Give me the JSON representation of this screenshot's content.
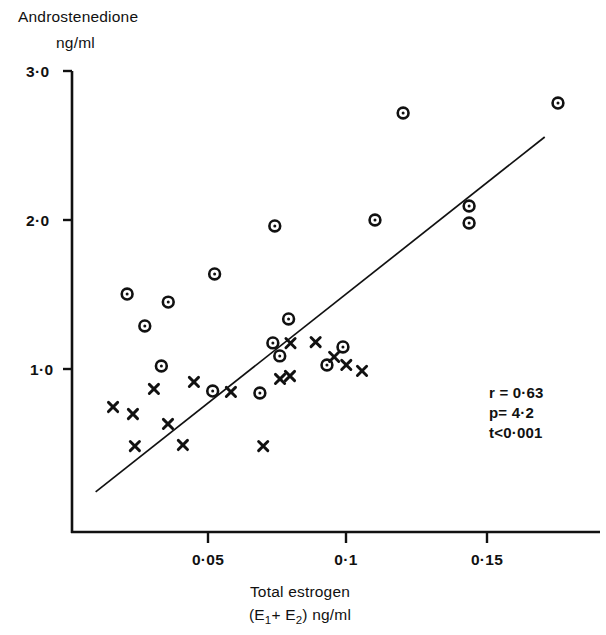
{
  "chart_data": {
    "type": "scatter",
    "title": "",
    "ylabel_lines": [
      "Androstenedione",
      "ng/ml"
    ],
    "xlabel_lines": [
      "Total   estrogen",
      "(E1+ E2)  ng/ml"
    ],
    "xlabel_line2_parts": [
      "(E",
      "1",
      "+ E",
      "2",
      ")  ng/ml"
    ],
    "xlim": [
      0.0,
      0.19
    ],
    "ylim": [
      0.0,
      3.0
    ],
    "xticks": [
      0.05,
      0.1,
      0.15
    ],
    "xticklabels": [
      "0·05",
      "0·1",
      "0·15"
    ],
    "yticks": [
      1.0,
      2.0,
      3.0
    ],
    "yticklabels": [
      "1·0",
      "2·0",
      "3·0"
    ],
    "grid": false,
    "legend": null,
    "marker_styles": {
      "circle": "open circle with centre dot",
      "cross": "x cross"
    },
    "series": [
      {
        "name": "circle-group",
        "marker": "circle",
        "points": [
          {
            "x": 0.0207,
            "y": 1.503
          },
          {
            "x": 0.0356,
            "y": 1.449
          },
          {
            "x": 0.0331,
            "y": 1.02
          },
          {
            "x": 0.0524,
            "y": 1.638
          },
          {
            "x": 0.0271,
            "y": 1.289
          },
          {
            "x": 0.0517,
            "y": 0.852
          },
          {
            "x": 0.0742,
            "y": 1.96
          },
          {
            "x": 0.0792,
            "y": 1.336
          },
          {
            "x": 0.0735,
            "y": 1.175
          },
          {
            "x": 0.076,
            "y": 1.088
          },
          {
            "x": 0.0688,
            "y": 0.839
          },
          {
            "x": 0.0989,
            "y": 1.148
          },
          {
            "x": 0.0931,
            "y": 1.027
          },
          {
            "x": 0.1105,
            "y": 2.0
          },
          {
            "x": 0.1207,
            "y": 2.718
          },
          {
            "x": 0.1446,
            "y": 2.094
          },
          {
            "x": 0.1446,
            "y": 1.98
          },
          {
            "x": 0.1768,
            "y": 2.785
          }
        ]
      },
      {
        "name": "cross-group",
        "marker": "cross",
        "points": [
          {
            "x": 0.0156,
            "y": 0.745
          },
          {
            "x": 0.0228,
            "y": 0.698
          },
          {
            "x": 0.0304,
            "y": 0.866
          },
          {
            "x": 0.0449,
            "y": 0.913
          },
          {
            "x": 0.0355,
            "y": 0.631
          },
          {
            "x": 0.0235,
            "y": 0.483
          },
          {
            "x": 0.0409,
            "y": 0.49
          },
          {
            "x": 0.07,
            "y": 0.483
          },
          {
            "x": 0.0583,
            "y": 0.846
          },
          {
            "x": 0.0761,
            "y": 0.933
          },
          {
            "x": 0.0797,
            "y": 0.953
          },
          {
            "x": 0.0799,
            "y": 1.174
          },
          {
            "x": 0.089,
            "y": 1.181
          },
          {
            "x": 0.0957,
            "y": 1.081
          },
          {
            "x": 0.1001,
            "y": 1.027
          },
          {
            "x": 0.1058,
            "y": 0.987
          }
        ]
      }
    ],
    "regression_line": {
      "x_start": 0.0093,
      "y_start": 0.175,
      "x_end": 0.172,
      "y_end": 2.557
    },
    "annotations": [
      {
        "text": "r = 0·63"
      },
      {
        "text": "p= 4·2"
      },
      {
        "text": "t<0·001"
      }
    ]
  }
}
